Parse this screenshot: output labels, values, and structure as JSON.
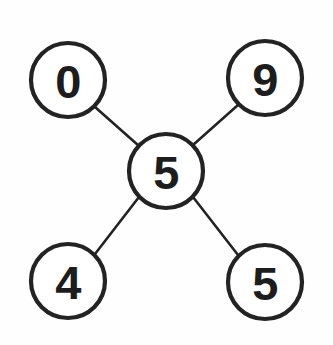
{
  "graph": {
    "background_color": "#fefefe",
    "node_fill": "#ffffff",
    "node_stroke": "#232323",
    "edge_stroke": "#232323",
    "label_color": "#1d1d1d",
    "node_radius": 37,
    "nodes": [
      {
        "id": "top-left",
        "label": "0",
        "cx": 68,
        "cy": 80
      },
      {
        "id": "top-right",
        "label": "9",
        "cx": 265,
        "cy": 78
      },
      {
        "id": "center",
        "label": "5",
        "cx": 166,
        "cy": 171
      },
      {
        "id": "bottom-left",
        "label": "4",
        "cx": 68,
        "cy": 281
      },
      {
        "id": "bottom-right",
        "label": "5",
        "cx": 265,
        "cy": 282
      }
    ],
    "edges": [
      {
        "id": "edge-center-top-left",
        "from": "center",
        "to": "top-left",
        "x1": 139,
        "y1": 146,
        "x2": 95,
        "y2": 107
      },
      {
        "id": "edge-center-top-right",
        "from": "center",
        "to": "top-right",
        "x1": 193,
        "y1": 145,
        "x2": 238,
        "y2": 105
      },
      {
        "id": "edge-center-bottom-left",
        "from": "center",
        "to": "bottom-left",
        "x1": 139,
        "y1": 197,
        "x2": 95,
        "y2": 254
      },
      {
        "id": "edge-center-bottom-right",
        "from": "center",
        "to": "bottom-right",
        "x1": 193,
        "y1": 197,
        "x2": 238,
        "y2": 255
      }
    ]
  }
}
